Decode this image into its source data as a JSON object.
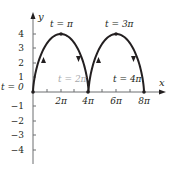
{
  "chart_data": {
    "type": "line",
    "title": "",
    "xlabel": "x",
    "ylabel": "y",
    "parametric": {
      "x": "2(t - sin t)",
      "y": "2(1 - cos t)",
      "t_range": [
        0,
        "4π"
      ]
    },
    "x_ticks": [
      "2π",
      "4π",
      "6π",
      "8π"
    ],
    "x_tick_values": [
      6.283,
      12.566,
      18.85,
      25.133
    ],
    "y_ticks": [
      "4",
      "3",
      "2",
      "1",
      "−1",
      "−2",
      "−3",
      "−4"
    ],
    "y_tick_values": [
      4,
      3,
      2,
      1,
      -1,
      -2,
      -3,
      -4
    ],
    "xlim": [
      0,
      28
    ],
    "ylim": [
      -5,
      5
    ],
    "key_points": [
      {
        "label": "t = 0",
        "x": 0,
        "y": 0
      },
      {
        "label": "t = π",
        "x": 6.283,
        "y": 4
      },
      {
        "label": "t = 2π",
        "x": 12.566,
        "y": 0
      },
      {
        "label": "t = 3π",
        "x": 18.85,
        "y": 4
      },
      {
        "label": "t = 4π",
        "x": 25.133,
        "y": 0
      }
    ],
    "grid": false,
    "legend": null
  },
  "labels": {
    "x_axis": "x",
    "y_axis": "y",
    "t0": "t = 0",
    "tpi": "t = π",
    "t2pi": "t = 2π",
    "t3pi": "t = 3π",
    "t4pi": "t = 4π",
    "xt_2pi": "2π",
    "xt_4pi": "4π",
    "xt_6pi": "6π",
    "xt_8pi": "8π",
    "yt_4": "4",
    "yt_3": "3",
    "yt_2": "2",
    "yt_1": "1",
    "yt_m1": "−1",
    "yt_m2": "−2",
    "yt_m3": "−3",
    "yt_m4": "−4"
  },
  "colors": {
    "curve": "#231f20",
    "axis": "#8a8c8e",
    "grey_label": "#a7a9ac"
  }
}
